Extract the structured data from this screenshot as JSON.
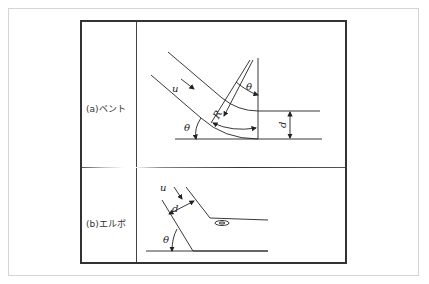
{
  "rows": [
    {
      "label": "(a)ベント",
      "symbols": {
        "velocity": "u",
        "angle": "θ",
        "radius": "R",
        "diameter": "d"
      }
    },
    {
      "label": "(b)エルボ",
      "symbols": {
        "velocity": "u",
        "angle": "θ",
        "diameter": "d"
      }
    }
  ]
}
